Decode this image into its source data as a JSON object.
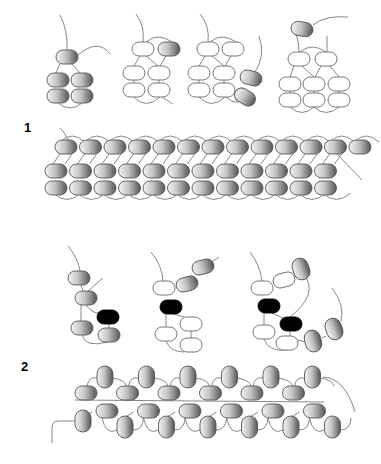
{
  "figure": {
    "labels": [
      {
        "id": "fig-1",
        "text": "1",
        "x": 24,
        "y": 120
      },
      {
        "id": "fig-2",
        "text": "2",
        "x": 21,
        "y": 359
      }
    ],
    "colors": {
      "background": "#ffffff",
      "thread": "#7a7a7a",
      "bead_outline": "#6a6a6a",
      "bead_fill_white": "#ffffff",
      "bead_shade_light": "#f2f2f2",
      "bead_shade_dark": "#5a5a5a",
      "bead_black": "#000000"
    },
    "bead_types": [
      "shaded",
      "outline",
      "black"
    ],
    "steps_fig1": [
      {
        "name": "step-1a",
        "beads": [
          {
            "x": 56,
            "y": 50,
            "w": 22,
            "h": 14,
            "type": "shaded"
          },
          {
            "x": 47,
            "y": 73,
            "w": 22,
            "h": 14,
            "type": "shaded"
          },
          {
            "x": 71,
            "y": 73,
            "w": 22,
            "h": 14,
            "type": "shaded"
          },
          {
            "x": 47,
            "y": 89,
            "w": 22,
            "h": 14,
            "type": "shaded"
          },
          {
            "x": 71,
            "y": 89,
            "w": 22,
            "h": 14,
            "type": "shaded"
          }
        ],
        "threads": [
          "M60 15 Q68 30 67 50",
          "M78 55 Q98 38 110 54",
          "M60 64 L56 73",
          "M72 64 L80 73",
          "M58 103 Q70 113 82 103"
        ]
      },
      {
        "name": "step-1b",
        "beads": [
          {
            "x": 132,
            "y": 42,
            "w": 22,
            "h": 14,
            "type": "outline"
          },
          {
            "x": 158,
            "y": 42,
            "w": 22,
            "h": 14,
            "type": "shaded"
          },
          {
            "x": 123,
            "y": 66,
            "w": 22,
            "h": 14,
            "type": "outline"
          },
          {
            "x": 148,
            "y": 66,
            "w": 22,
            "h": 14,
            "type": "outline"
          },
          {
            "x": 123,
            "y": 83,
            "w": 22,
            "h": 14,
            "type": "outline"
          },
          {
            "x": 148,
            "y": 83,
            "w": 22,
            "h": 14,
            "type": "outline"
          }
        ],
        "threads": [
          "M136 14 Q145 26 143 42",
          "M146 42 Q158 32 172 42",
          "M140 56 L134 66",
          "M146 56 L158 66",
          "M166 56 L160 66",
          "M134 80 L134 83",
          "M159 80 L159 83",
          "M134 97 Q146 110 160 97",
          "M162 97 L173 104"
        ]
      },
      {
        "name": "step-1c",
        "beads": [
          {
            "x": 197,
            "y": 42,
            "w": 22,
            "h": 14,
            "type": "outline"
          },
          {
            "x": 222,
            "y": 42,
            "w": 22,
            "h": 14,
            "type": "outline"
          },
          {
            "x": 188,
            "y": 66,
            "w": 22,
            "h": 14,
            "type": "outline"
          },
          {
            "x": 213,
            "y": 66,
            "w": 22,
            "h": 14,
            "type": "outline"
          },
          {
            "x": 188,
            "y": 83,
            "w": 22,
            "h": 14,
            "type": "outline"
          },
          {
            "x": 213,
            "y": 83,
            "w": 22,
            "h": 14,
            "type": "outline"
          },
          {
            "x": 240,
            "y": 71,
            "w": 22,
            "h": 14,
            "type": "shaded",
            "rot": 15
          },
          {
            "x": 234,
            "y": 90,
            "w": 22,
            "h": 14,
            "type": "shaded",
            "rot": 30
          }
        ],
        "threads": [
          "M200 14 Q210 26 208 42",
          "M210 42 Q222 32 236 42",
          "M205 56 L199 66",
          "M212 56 L224 66",
          "M231 56 L225 66",
          "M199 80 L199 83",
          "M224 80 L224 83",
          "M199 97 Q211 110 225 97",
          "M226 97 Q238 108 246 96",
          "M255 72 Q266 55 259 36"
        ]
      },
      {
        "name": "step-1d",
        "beads": [
          {
            "x": 291,
            "y": 22,
            "w": 22,
            "h": 14,
            "type": "shaded",
            "rot": 10
          },
          {
            "x": 288,
            "y": 52,
            "w": 22,
            "h": 14,
            "type": "outline"
          },
          {
            "x": 315,
            "y": 52,
            "w": 22,
            "h": 14,
            "type": "outline"
          }
        ],
        "extra_beads": [
          {
            "x": 279,
            "y": 77,
            "w": 22,
            "h": 14,
            "type": "outline"
          },
          {
            "x": 303,
            "y": 77,
            "w": 22,
            "h": 14,
            "type": "outline"
          },
          {
            "x": 328,
            "y": 77,
            "w": 22,
            "h": 14,
            "type": "outline"
          },
          {
            "x": 279,
            "y": 93,
            "w": 22,
            "h": 14,
            "type": "outline"
          },
          {
            "x": 303,
            "y": 93,
            "w": 22,
            "h": 14,
            "type": "outline"
          },
          {
            "x": 328,
            "y": 93,
            "w": 22,
            "h": 14,
            "type": "outline"
          }
        ],
        "threads": [
          "M292 25 Q299 38 299 52",
          "M313 25 Q325 15 348 17",
          "M327 36 L327 52",
          "M300 52 Q312 42 326 52",
          "M294 66 L290 77",
          "M302 66 L314 77",
          "M321 66 L315 77",
          "M330 66 L339 77",
          "M290 91 L290 93",
          "M314 91 L314 93",
          "M339 91 L339 93",
          "M290 107 Q302 118 314 107",
          "M314 107 Q326 118 339 107"
        ]
      }
    ],
    "band_fig1": {
      "top_row": {
        "x0": 55,
        "y": 140,
        "count": 13,
        "step": 24.5,
        "w": 22,
        "h": 14
      },
      "mid_row": {
        "x0": 45,
        "y": 164,
        "count": 12,
        "step": 24.5,
        "w": 22,
        "h": 14
      },
      "bot_row": {
        "x0": 45,
        "y": 181,
        "count": 12,
        "step": 24.5,
        "w": 22,
        "h": 14
      },
      "tail_in": "M60 128 Q66 134 68 140",
      "tail_out": "M337 154 L362 180"
    },
    "steps_fig2": [
      {
        "name": "step-2a",
        "beads": [
          {
            "x": 68,
            "y": 271,
            "w": 22,
            "h": 14,
            "type": "shaded"
          },
          {
            "x": 75,
            "y": 291,
            "w": 22,
            "h": 14,
            "type": "shaded"
          },
          {
            "x": 97,
            "y": 310,
            "w": 22,
            "h": 14,
            "type": "black"
          },
          {
            "x": 71,
            "y": 321,
            "w": 22,
            "h": 14,
            "type": "shaded"
          },
          {
            "x": 98,
            "y": 328,
            "w": 22,
            "h": 14,
            "type": "shaded"
          }
        ],
        "threads": [
          "M68 246 Q78 258 80 271",
          "M88 291 L103 278",
          "M81 285 L83 291",
          "M86 305 Q92 313 98 313",
          "M81 305 L81 321",
          "M109 324 L109 328",
          "M82 335 Q85 348 108 342"
        ]
      },
      {
        "name": "step-2b",
        "beads": [
          {
            "x": 153,
            "y": 281,
            "w": 22,
            "h": 14,
            "type": "outline"
          },
          {
            "x": 176,
            "y": 277,
            "w": 22,
            "h": 14,
            "type": "shaded",
            "rot": -15
          },
          {
            "x": 192,
            "y": 260,
            "w": 22,
            "h": 14,
            "type": "shaded",
            "rot": -15
          },
          {
            "x": 160,
            "y": 300,
            "w": 22,
            "h": 14,
            "type": "black"
          },
          {
            "x": 180,
            "y": 317,
            "w": 22,
            "h": 14,
            "type": "outline"
          },
          {
            "x": 155,
            "y": 327,
            "w": 22,
            "h": 14,
            "type": "outline"
          },
          {
            "x": 180,
            "y": 338,
            "w": 22,
            "h": 14,
            "type": "outline"
          }
        ],
        "threads": [
          "M151 252 Q162 265 163 281",
          "M168 295 L174 287",
          "M212 262 L219 257",
          "M166 314 L166 327",
          "M174 314 L184 317",
          "M191 331 L191 338",
          "M166 341 Q170 352 184 352"
        ]
      },
      {
        "name": "step-2c",
        "beads": [
          {
            "x": 251,
            "y": 281,
            "w": 22,
            "h": 14,
            "type": "outline"
          },
          {
            "x": 273,
            "y": 273,
            "w": 22,
            "h": 14,
            "type": "outline",
            "rot": -15
          },
          {
            "x": 293,
            "y": 258,
            "w": 16,
            "h": 22,
            "type": "shaded",
            "rot": -20
          },
          {
            "x": 258,
            "y": 299,
            "w": 22,
            "h": 14,
            "type": "black"
          },
          {
            "x": 280,
            "y": 317,
            "w": 22,
            "h": 14,
            "type": "black"
          },
          {
            "x": 253,
            "y": 325,
            "w": 22,
            "h": 14,
            "type": "outline"
          },
          {
            "x": 276,
            "y": 336,
            "w": 22,
            "h": 14,
            "type": "outline"
          },
          {
            "x": 305,
            "y": 330,
            "w": 16,
            "h": 22,
            "type": "shaded",
            "rot": -15
          },
          {
            "x": 326,
            "y": 318,
            "w": 16,
            "h": 22,
            "type": "shaded",
            "rot": -20
          }
        ],
        "threads": [
          "M250 252 Q260 265 262 281",
          "M266 295 L272 287",
          "M305 276 Q318 295 290 317",
          "M264 313 L264 325",
          "M272 313 L283 318",
          "M290 331 L290 336",
          "M264 339 Q268 352 287 350",
          "M298 340 L305 342",
          "M322 338 L326 336",
          "M341 321 Q345 305 332 288"
        ]
      }
    ],
    "band_fig2": {
      "period": 41.5,
      "count": 6,
      "top_vertical": {
        "x0": 97,
        "y": 366,
        "w": 16,
        "h": 22
      },
      "mid_horizontal_a": {
        "x0": 75,
        "y": 386,
        "w": 22,
        "h": 14
      },
      "mid_horizontal_b": {
        "x0": 96,
        "y": 404,
        "w": 22,
        "h": 14
      },
      "bottom_vertical": {
        "x0": 117,
        "y": 416,
        "w": 16,
        "h": 22
      },
      "first_vertical": {
        "x": 75,
        "y": 410,
        "w": 16,
        "h": 22
      },
      "tail_in": "M75 421 L58 421 Q52 421 52 428 L52 443",
      "tail_out": "M323 377 Q345 378 355 412"
    }
  }
}
